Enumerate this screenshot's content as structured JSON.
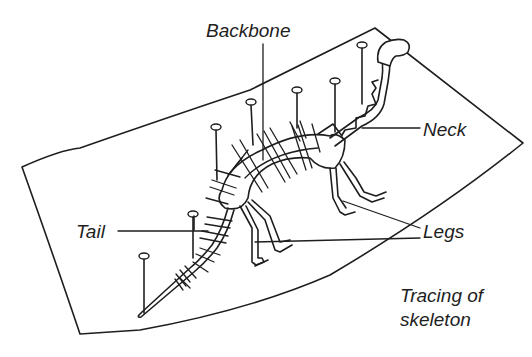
{
  "figure": {
    "labels": {
      "backbone": "Backbone",
      "neck": "Neck",
      "tail": "Tail",
      "legs": "Legs"
    },
    "caption": {
      "line1": "Tracing of",
      "line2": "skeleton"
    },
    "colors": {
      "ink": "#1e1e1e",
      "paper": "#ffffff"
    },
    "pin_count": 8
  }
}
